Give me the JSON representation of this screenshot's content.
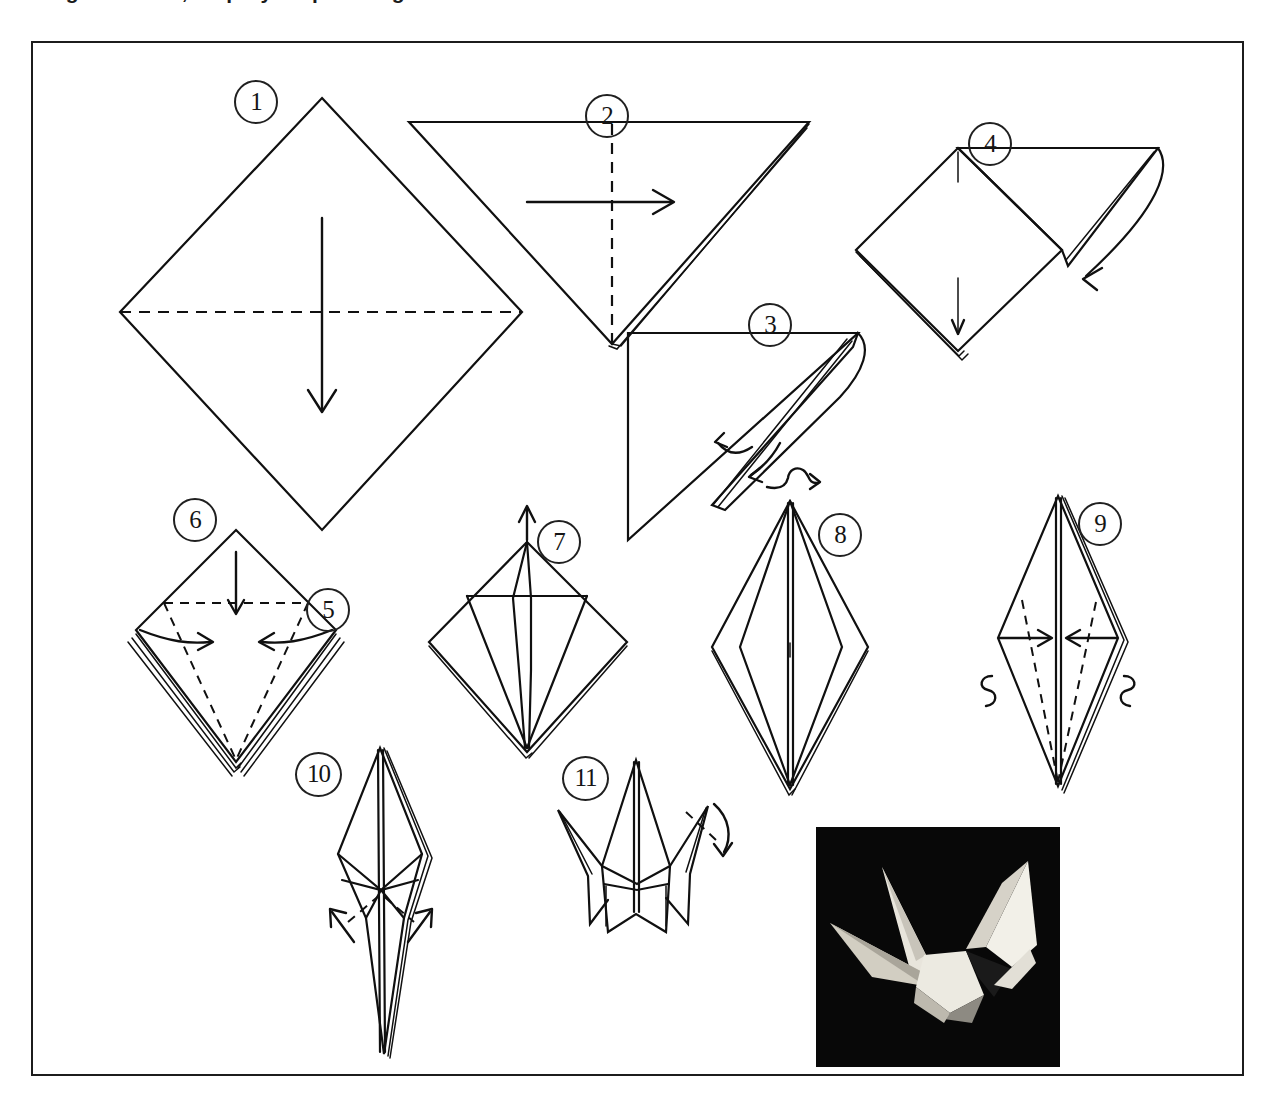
{
  "document": {
    "caption_partial": "Origami crane, step-by-step folding",
    "figure_border_color": "#1c1c1c",
    "ink_color": "#101010",
    "paper_color": "#ffffff"
  },
  "steps": [
    {
      "number": "1",
      "label": "1",
      "name": "square-diamond-with-horizontal-valley-fold",
      "description": "Square sheet oriented as a diamond with a horizontal dashed fold line across the middle and a downward arrow",
      "fold_lines": [
        "horizontal-dashed"
      ],
      "arrows": [
        "down"
      ]
    },
    {
      "number": "2",
      "label": "2",
      "name": "folded-triangle-with-vertical-fold",
      "description": "Downward pointing triangle with a vertical dashed centre fold line and a rightward arrow",
      "fold_lines": [
        "vertical-dashed"
      ],
      "arrows": [
        "right"
      ]
    },
    {
      "number": "3",
      "label": "3",
      "name": "open-squash-fold-right-triangle",
      "description": "Right triangle with the top flap being opened and squashed; two curved arrows",
      "fold_lines": [],
      "arrows": [
        "curve-left",
        "curve-down-left"
      ]
    },
    {
      "number": "4",
      "label": "4",
      "name": "square-with-flap-folded-down",
      "description": "Square base with a flap swinging down to the lower right; short vertical reference line",
      "fold_lines": [],
      "arrows": [
        "curve-down-right"
      ]
    },
    {
      "number": "5",
      "label": "5",
      "name": "preliminary-base-side-arrows",
      "description": "Preliminary base, arrows folding left and right edges toward the centre line",
      "fold_lines": [
        "left-diagonal-dashed",
        "right-diagonal-dashed"
      ],
      "arrows": [
        "in-from-left",
        "in-from-right"
      ]
    },
    {
      "number": "6",
      "label": "6",
      "name": "preliminary-base-top-fold",
      "description": "Same preliminary base with horizontal dashed crease near the top and a downward arrow",
      "fold_lines": [
        "horizontal-dashed-top"
      ],
      "arrows": [
        "down"
      ]
    },
    {
      "number": "7",
      "label": "7",
      "name": "petal-fold-lift-upward",
      "description": "Kite-shaped base after side folds, the front point being lifted upward",
      "fold_lines": [
        "horizontal-crease"
      ],
      "arrows": [
        "up"
      ]
    },
    {
      "number": "8",
      "label": "8",
      "name": "bird-base-completed",
      "description": "Completed bird base, wide in the middle, narrow top and bottom points",
      "fold_lines": [],
      "arrows": [
        "turn-over-loop"
      ]
    },
    {
      "number": "9",
      "label": "9",
      "name": "narrow-the-base",
      "description": "Elongated diamond with dashed creases, arrows folding left and right toward centre, curl symbols on both sides",
      "fold_lines": [
        "left-diagonal-dashed",
        "right-diagonal-dashed"
      ],
      "arrows": [
        "in-from-left",
        "in-from-right",
        "curl-left",
        "curl-right"
      ]
    },
    {
      "number": "10",
      "label": "10",
      "name": "inside-reverse-fold-legs",
      "description": "Narrow diamond with dashed crease and two outward arrows for the inside reverse folds of the neck and tail",
      "fold_lines": [
        "v-dashed"
      ],
      "arrows": [
        "out-up-left",
        "out-up-right"
      ]
    },
    {
      "number": "11",
      "label": "11",
      "name": "reverse-fold-the-head",
      "description": "Almost finished crane with a dashed crease and curved arrow forming the head",
      "fold_lines": [
        "head-dashed"
      ],
      "arrows": [
        "curve-down-head"
      ]
    }
  ],
  "photo": {
    "name": "finished-crane-photograph",
    "description": "Black and white photograph of the finished paper crane against a black background",
    "background_color": "#0a0a0a",
    "paper_color": "#f2f0ea"
  },
  "symbols": {
    "turn_over": "turn-over-loop-symbol",
    "valley_fold": "dashed-line",
    "fold_direction": "solid-arrow"
  }
}
